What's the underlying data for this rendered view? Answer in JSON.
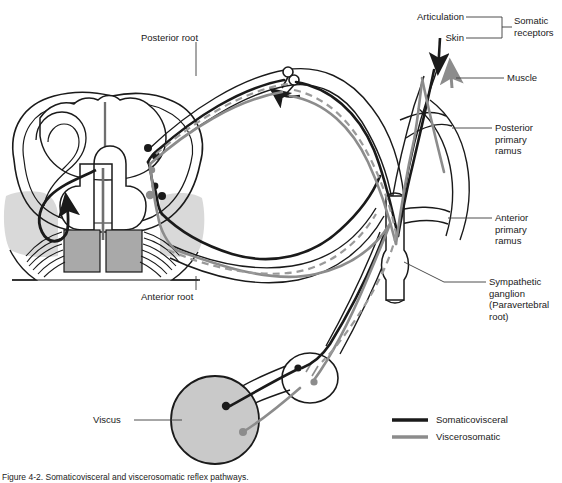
{
  "figure": {
    "domain": "anatomical-diagram",
    "caption": "Figure 4-2.  Somaticovisceral and viscerosomatic reflex pathways.",
    "colors": {
      "somaticovisceral": "#1a1a1a",
      "viscerosomatic": "#8c8c8c",
      "gray_matter_fill": "#a9a9a9",
      "light_fill": "#d9d9d9",
      "viscus_fill": "#c9c9c9",
      "outline": "#1a1a1a",
      "background": "#ffffff"
    }
  },
  "labels": {
    "posterior_root": "Posterior root",
    "anterior_root": "Anterior root",
    "articulation": "Articulation",
    "skin": "Skin",
    "somatic_receptors": "Somatic\nreceptors",
    "muscle": "Muscle",
    "posterior_primary_ramus": "Posterior primary\nramus",
    "anterior_primary_ramus": "Anterior primary\nramus",
    "sympathetic_ganglion": "Sympathetic\nganglion\n(Paravertebral\nroot)",
    "viscus": "Viscus"
  },
  "legend": {
    "items": [
      {
        "label": "Somaticovisceral",
        "color": "#1a1a1a"
      },
      {
        "label": "Viscerosomatic",
        "color": "#8c8c8c"
      }
    ]
  },
  "structures": [
    {
      "name": "spinal-cord-cross-section",
      "note": "butterfly gray matter with dorsal and ventral horns"
    },
    {
      "name": "dorsal-root-ganglion",
      "note": "cell bodies on posterior root"
    },
    {
      "name": "paravertebral-sympathetic-ganglion",
      "note": "vertical chain ganglion"
    },
    {
      "name": "prevertebral-ganglion",
      "note": "oval ganglion near viscus"
    },
    {
      "name": "viscus-organ",
      "note": "shaded circular organ"
    }
  ]
}
